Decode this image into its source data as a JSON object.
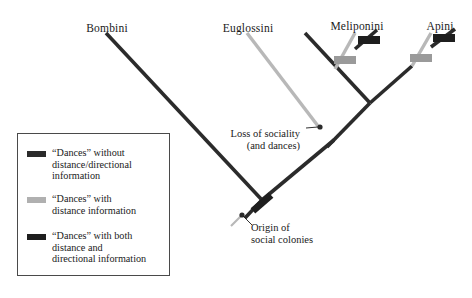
{
  "figure": {
    "type": "phylogenetic-tree",
    "title": "",
    "background_color": "#ffffff"
  },
  "colors": {
    "dark": "#2b2b2b",
    "black_bar": "#1e1e1e",
    "light_gray": "#b8b8b8",
    "medium_gray": "#9a9a9a",
    "legend_border": "#4a4a4a",
    "text": "#1a1a1a"
  },
  "taxa": [
    {
      "id": "bombini",
      "label": "Bombini",
      "x": 107,
      "y": 22
    },
    {
      "id": "euglossini",
      "label": "Euglossini",
      "x": 248,
      "y": 22
    },
    {
      "id": "meliponini",
      "label": "Meliponini",
      "x": 357,
      "y": 20
    },
    {
      "id": "apini",
      "label": "Apini",
      "x": 440,
      "y": 20
    }
  ],
  "annotations": [
    {
      "id": "loss-of-sociality",
      "lines": [
        "Loss of sociality",
        "(and dances)"
      ],
      "text_x": 300,
      "text_y": 128,
      "node_x": 321,
      "node_y": 127
    },
    {
      "id": "origin-of-social-colonies",
      "lines": [
        "Origin of",
        "social colonies"
      ],
      "text_x": 251,
      "text_y": 222,
      "node_x": 242,
      "node_y": 215
    }
  ],
  "branches": [
    {
      "id": "bombini-branch",
      "style": "dark",
      "x1": 106,
      "y1": 33,
      "x2": 262,
      "y2": 200
    },
    {
      "id": "euglossini-branch",
      "style": "light",
      "x1": 247,
      "y1": 33,
      "x2": 318,
      "y2": 126
    },
    {
      "id": "root-stem",
      "style": "dark",
      "x1": 262,
      "y1": 200,
      "x2": 245,
      "y2": 218
    },
    {
      "id": "crown-branch",
      "style": "dark",
      "x1": 262,
      "y1": 200,
      "x2": 334,
      "y2": 140
    },
    {
      "id": "social-backbone",
      "style": "dark",
      "x1": 327,
      "y1": 147,
      "x2": 370,
      "y2": 103
    },
    {
      "id": "meliponini-backbone",
      "style": "dark",
      "x1": 370,
      "y1": 103,
      "x2": 305,
      "y2": 33
    },
    {
      "id": "apini-backbone",
      "style": "dark",
      "x1": 370,
      "y1": 103,
      "x2": 412,
      "y2": 66
    },
    {
      "id": "meliponini-stem",
      "style": "light",
      "x1": 335,
      "y1": 69,
      "x2": 355,
      "y2": 33
    },
    {
      "id": "meliponini-tip",
      "style": "dark",
      "x1": 355,
      "y1": 49,
      "x2": 377,
      "y2": 30
    },
    {
      "id": "apini-stem",
      "style": "light",
      "x1": 412,
      "y1": 66,
      "x2": 431,
      "y2": 33
    },
    {
      "id": "apini-tip",
      "style": "dark",
      "x1": 431,
      "y1": 47,
      "x2": 455,
      "y2": 29
    },
    {
      "id": "origin-tail",
      "style": "light",
      "x1": 241,
      "y1": 216,
      "x2": 231,
      "y2": 226
    }
  ],
  "markers": [
    {
      "id": "origin-bar",
      "style": "black_bar",
      "x": 262,
      "y": 203,
      "w": 24,
      "h": 7,
      "angle": -41
    },
    {
      "id": "meliponini-gray-bar",
      "style": "gray_bar",
      "x": 345,
      "y": 60,
      "w": 22,
      "h": 8,
      "angle": 0
    },
    {
      "id": "meliponini-black-bar",
      "style": "black_bar",
      "x": 369,
      "y": 40,
      "w": 22,
      "h": 8,
      "angle": 0
    },
    {
      "id": "apini-gray-bar",
      "style": "gray_bar",
      "x": 421,
      "y": 58,
      "w": 22,
      "h": 8,
      "angle": 0
    },
    {
      "id": "apini-black-bar",
      "style": "black_bar",
      "x": 444,
      "y": 38,
      "w": 22,
      "h": 8,
      "angle": 0
    }
  ],
  "nodes": [
    {
      "id": "loss-node",
      "x": 320,
      "y": 127,
      "r": 2.6,
      "style": "dark"
    },
    {
      "id": "origin-node",
      "x": 242,
      "y": 215,
      "r": 2.6,
      "style": "dark"
    }
  ],
  "legend": {
    "border_color": "#4a4a4a",
    "items": [
      {
        "id": "dances-without",
        "swatch": "#2b2b2b",
        "lines": [
          "“Dances” without",
          "distance/directional",
          "information"
        ]
      },
      {
        "id": "dances-with-distance",
        "swatch": "#b0b0b0",
        "lines": [
          "“Dances” with",
          "distance information"
        ]
      },
      {
        "id": "dances-with-both",
        "swatch": "#1e1e1e",
        "lines": [
          "“Dances” with both",
          "distance and",
          "directional information"
        ]
      }
    ]
  }
}
